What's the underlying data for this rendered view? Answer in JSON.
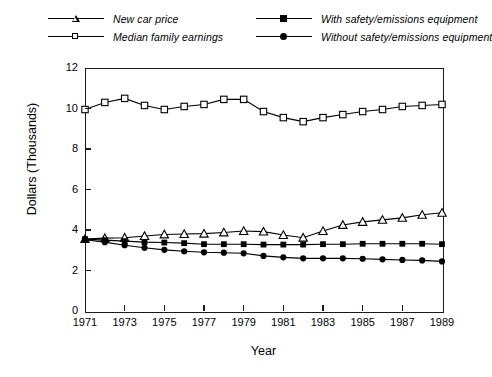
{
  "chart_data": {
    "type": "line",
    "title": "",
    "xlabel": "Year",
    "ylabel": "Dollars (Thousands)",
    "x": [
      1971,
      1972,
      1973,
      1974,
      1975,
      1976,
      1977,
      1978,
      1979,
      1980,
      1981,
      1982,
      1983,
      1984,
      1985,
      1986,
      1987,
      1988,
      1989
    ],
    "xlim": [
      1971,
      1989
    ],
    "ylim": [
      0,
      12
    ],
    "xticks": [
      1971,
      1973,
      1975,
      1977,
      1979,
      1981,
      1983,
      1985,
      1987,
      1989
    ],
    "xtick_labels": [
      "1971",
      "1973",
      "1975",
      "1977",
      "1979",
      "1981",
      "1983",
      "1985",
      "1987",
      "1989"
    ],
    "yticks": [
      0,
      2,
      4,
      6,
      8,
      10,
      12
    ],
    "ytick_labels": [
      "0",
      "2",
      "4",
      "6",
      "8",
      "10",
      "12"
    ],
    "grid": false,
    "legend_position": "above-plot",
    "series": [
      {
        "name": "New car price",
        "marker": "triangle-open",
        "values": [
          3.55,
          3.6,
          3.62,
          3.7,
          3.78,
          3.8,
          3.82,
          3.88,
          3.95,
          3.92,
          3.75,
          3.62,
          3.95,
          4.25,
          4.4,
          4.5,
          4.6,
          4.75,
          4.85
        ]
      },
      {
        "name": "Median family earnings",
        "marker": "square-open",
        "values": [
          9.95,
          10.3,
          10.5,
          10.15,
          9.95,
          10.1,
          10.2,
          10.45,
          10.45,
          9.85,
          9.55,
          9.35,
          9.55,
          9.7,
          9.85,
          9.95,
          10.1,
          10.15,
          10.2
        ]
      },
      {
        "name": "With safety/emissions equipment",
        "marker": "square-filled",
        "values": [
          3.55,
          3.5,
          3.45,
          3.4,
          3.38,
          3.35,
          3.3,
          3.3,
          3.3,
          3.28,
          3.28,
          3.28,
          3.3,
          3.3,
          3.32,
          3.32,
          3.32,
          3.32,
          3.3
        ]
      },
      {
        "name": "Without safety/emissions equipment",
        "marker": "circle-filled",
        "values": [
          3.52,
          3.4,
          3.25,
          3.12,
          3.02,
          2.95,
          2.9,
          2.88,
          2.85,
          2.72,
          2.65,
          2.6,
          2.6,
          2.6,
          2.58,
          2.55,
          2.52,
          2.5,
          2.45
        ]
      }
    ],
    "colors": {
      "line": "#000000",
      "marker_fill": "#000000",
      "marker_open": "#ffffff",
      "axis": "#1a1a1a",
      "background": "#ffffff"
    }
  },
  "legend": {
    "entries": [
      {
        "label": "New car price",
        "marker": "triangle-open"
      },
      {
        "label": "Median family earnings",
        "marker": "square-open"
      },
      {
        "label": "With safety/emissions equipment",
        "marker": "square-filled"
      },
      {
        "label": "Without safety/emissions equipment",
        "marker": "circle-filled"
      }
    ]
  }
}
